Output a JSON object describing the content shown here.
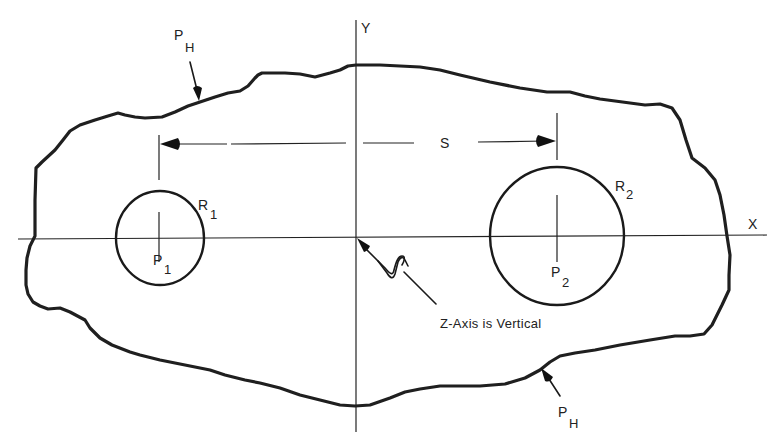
{
  "figure": {
    "axes": {
      "x_label": "X",
      "y_label": "Y"
    },
    "boundary_label": {
      "main": "P",
      "subscript": "H"
    },
    "hole_1": {
      "radius_label": "R",
      "radius_subscript": "1",
      "point_label": "P",
      "point_subscript": "1"
    },
    "hole_2": {
      "radius_label": "R",
      "radius_subscript": "2",
      "point_label": "P",
      "point_subscript": "2"
    },
    "spacing_label": "S",
    "z_axis_note": "Z-Axis is Vertical",
    "colors": {
      "ink": "#1f1f1f",
      "background": "#ffffff"
    }
  }
}
